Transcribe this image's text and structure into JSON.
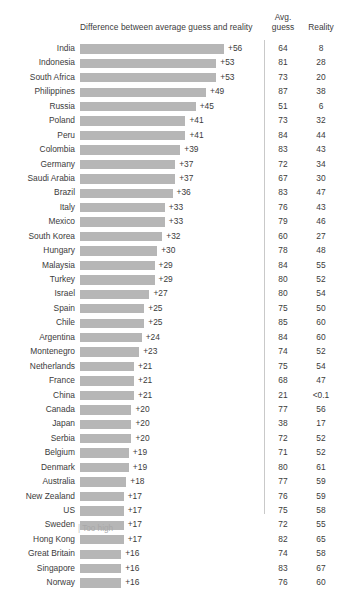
{
  "header": {
    "bar_title": "Difference between average guess and reality",
    "guess_line1": "Avg.",
    "guess_line2": "guess",
    "reality": "Reality"
  },
  "footnote": {
    "tick": "|",
    "label": "Too high"
  },
  "chart_data": {
    "type": "bar",
    "title": "Difference between average guess and reality",
    "xlabel": "",
    "ylabel": "",
    "orientation": "horizontal",
    "grid": false,
    "legend": false,
    "xlim": [
      0,
      56
    ],
    "bar_color": "#b6b6b6",
    "columns": [
      "Country",
      "Difference between average guess and reality",
      "Avg. guess",
      "Reality"
    ],
    "categories": [
      "India",
      "Indonesia",
      "South Africa",
      "Philippines",
      "Russia",
      "Poland",
      "Peru",
      "Colombia",
      "Germany",
      "Saudi Arabia",
      "Brazil",
      "Italy",
      "Mexico",
      "South Korea",
      "Hungary",
      "Malaysia",
      "Turkey",
      "Israel",
      "Spain",
      "Chile",
      "Argentina",
      "Montenegro",
      "Netherlands",
      "France",
      "China",
      "Canada",
      "Japan",
      "Serbia",
      "Belgium",
      "Denmark",
      "Australia",
      "New Zealand",
      "US",
      "Sweden",
      "Hong Kong",
      "Great Britain",
      "Singapore",
      "Norway"
    ],
    "values": [
      56,
      53,
      53,
      49,
      45,
      41,
      41,
      39,
      37,
      37,
      36,
      33,
      33,
      32,
      30,
      29,
      29,
      27,
      25,
      25,
      24,
      23,
      21,
      21,
      21,
      20,
      20,
      20,
      19,
      19,
      18,
      17,
      17,
      17,
      17,
      16,
      16,
      16
    ],
    "series": [
      {
        "name": "Avg. guess",
        "values": [
          64,
          81,
          73,
          87,
          51,
          73,
          84,
          83,
          72,
          67,
          83,
          76,
          79,
          60,
          78,
          84,
          80,
          80,
          75,
          85,
          84,
          74,
          75,
          68,
          21,
          77,
          38,
          72,
          71,
          80,
          77,
          76,
          75,
          72,
          82,
          74,
          83,
          76
        ]
      },
      {
        "name": "Reality",
        "values": [
          8,
          28,
          20,
          38,
          6,
          32,
          44,
          43,
          34,
          30,
          47,
          43,
          46,
          27,
          48,
          55,
          52,
          54,
          50,
          60,
          60,
          52,
          54,
          47,
          "<0.1",
          56,
          17,
          52,
          52,
          61,
          59,
          59,
          58,
          55,
          65,
          58,
          67,
          60
        ]
      }
    ]
  },
  "rows": [
    {
      "country": "India",
      "diff": 56,
      "diff_label": "+56",
      "guess": "64",
      "reality": "8"
    },
    {
      "country": "Indonesia",
      "diff": 53,
      "diff_label": "+53",
      "guess": "81",
      "reality": "28"
    },
    {
      "country": "South Africa",
      "diff": 53,
      "diff_label": "+53",
      "guess": "73",
      "reality": "20"
    },
    {
      "country": "Philippines",
      "diff": 49,
      "diff_label": "+49",
      "guess": "87",
      "reality": "38"
    },
    {
      "country": "Russia",
      "diff": 45,
      "diff_label": "+45",
      "guess": "51",
      "reality": "6"
    },
    {
      "country": "Poland",
      "diff": 41,
      "diff_label": "+41",
      "guess": "73",
      "reality": "32"
    },
    {
      "country": "Peru",
      "diff": 41,
      "diff_label": "+41",
      "guess": "84",
      "reality": "44"
    },
    {
      "country": "Colombia",
      "diff": 39,
      "diff_label": "+39",
      "guess": "83",
      "reality": "43"
    },
    {
      "country": "Germany",
      "diff": 37,
      "diff_label": "+37",
      "guess": "72",
      "reality": "34"
    },
    {
      "country": "Saudi Arabia",
      "diff": 37,
      "diff_label": "+37",
      "guess": "67",
      "reality": "30"
    },
    {
      "country": "Brazil",
      "diff": 36,
      "diff_label": "+36",
      "guess": "83",
      "reality": "47"
    },
    {
      "country": "Italy",
      "diff": 33,
      "diff_label": "+33",
      "guess": "76",
      "reality": "43"
    },
    {
      "country": "Mexico",
      "diff": 33,
      "diff_label": "+33",
      "guess": "79",
      "reality": "46"
    },
    {
      "country": "South Korea",
      "diff": 32,
      "diff_label": "+32",
      "guess": "60",
      "reality": "27"
    },
    {
      "country": "Hungary",
      "diff": 30,
      "diff_label": "+30",
      "guess": "78",
      "reality": "48"
    },
    {
      "country": "Malaysia",
      "diff": 29,
      "diff_label": "+29",
      "guess": "84",
      "reality": "55"
    },
    {
      "country": "Turkey",
      "diff": 29,
      "diff_label": "+29",
      "guess": "80",
      "reality": "52"
    },
    {
      "country": "Israel",
      "diff": 27,
      "diff_label": "+27",
      "guess": "80",
      "reality": "54"
    },
    {
      "country": "Spain",
      "diff": 25,
      "diff_label": "+25",
      "guess": "75",
      "reality": "50"
    },
    {
      "country": "Chile",
      "diff": 25,
      "diff_label": "+25",
      "guess": "85",
      "reality": "60"
    },
    {
      "country": "Argentina",
      "diff": 24,
      "diff_label": "+24",
      "guess": "84",
      "reality": "60"
    },
    {
      "country": "Montenegro",
      "diff": 23,
      "diff_label": "+23",
      "guess": "74",
      "reality": "52"
    },
    {
      "country": "Netherlands",
      "diff": 21,
      "diff_label": "+21",
      "guess": "75",
      "reality": "54"
    },
    {
      "country": "France",
      "diff": 21,
      "diff_label": "+21",
      "guess": "68",
      "reality": "47"
    },
    {
      "country": "China",
      "diff": 21,
      "diff_label": "+21",
      "guess": "21",
      "reality": "<0.1"
    },
    {
      "country": "Canada",
      "diff": 20,
      "diff_label": "+20",
      "guess": "77",
      "reality": "56"
    },
    {
      "country": "Japan",
      "diff": 20,
      "diff_label": "+20",
      "guess": "38",
      "reality": "17"
    },
    {
      "country": "Serbia",
      "diff": 20,
      "diff_label": "+20",
      "guess": "72",
      "reality": "52"
    },
    {
      "country": "Belgium",
      "diff": 19,
      "diff_label": "+19",
      "guess": "71",
      "reality": "52"
    },
    {
      "country": "Denmark",
      "diff": 19,
      "diff_label": "+19",
      "guess": "80",
      "reality": "61"
    },
    {
      "country": "Australia",
      "diff": 18,
      "diff_label": "+18",
      "guess": "77",
      "reality": "59"
    },
    {
      "country": "New Zealand",
      "diff": 17,
      "diff_label": "+17",
      "guess": "76",
      "reality": "59"
    },
    {
      "country": "US",
      "diff": 17,
      "diff_label": "+17",
      "guess": "75",
      "reality": "58"
    },
    {
      "country": "Sweden",
      "diff": 17,
      "diff_label": "+17",
      "guess": "72",
      "reality": "55"
    },
    {
      "country": "Hong Kong",
      "diff": 17,
      "diff_label": "+17",
      "guess": "82",
      "reality": "65"
    },
    {
      "country": "Great Britain",
      "diff": 16,
      "diff_label": "+16",
      "guess": "74",
      "reality": "58"
    },
    {
      "country": "Singapore",
      "diff": 16,
      "diff_label": "+16",
      "guess": "83",
      "reality": "67"
    },
    {
      "country": "Norway",
      "diff": 16,
      "diff_label": "+16",
      "guess": "76",
      "reality": "60"
    }
  ]
}
